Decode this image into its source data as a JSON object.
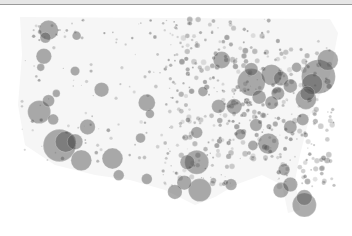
{
  "map": {
    "title": "",
    "region": "contiguous-united-states",
    "mark": "proportional-bubble",
    "bubble_fill": "#4a4a4a",
    "bubble_opacity": 0.45,
    "background_fill": "#f4f4f4",
    "bubbles": [
      {
        "name": "seattle",
        "x": 0.085,
        "y": 0.06,
        "v": 40
      },
      {
        "name": "tacoma",
        "x": 0.075,
        "y": 0.1,
        "v": 12
      },
      {
        "name": "spokane",
        "x": 0.175,
        "y": 0.09,
        "v": 8
      },
      {
        "name": "portland",
        "x": 0.07,
        "y": 0.2,
        "v": 25
      },
      {
        "name": "salem",
        "x": 0.06,
        "y": 0.26,
        "v": 6
      },
      {
        "name": "boise",
        "x": 0.17,
        "y": 0.28,
        "v": 9
      },
      {
        "name": "sf-bay",
        "x": 0.055,
        "y": 0.5,
        "v": 55
      },
      {
        "name": "sacramento",
        "x": 0.085,
        "y": 0.44,
        "v": 15
      },
      {
        "name": "fresno",
        "x": 0.1,
        "y": 0.54,
        "v": 12
      },
      {
        "name": "los-angeles",
        "x": 0.12,
        "y": 0.68,
        "v": 110
      },
      {
        "name": "la-core",
        "x": 0.14,
        "y": 0.66,
        "v": 45
      },
      {
        "name": "inland-empire",
        "x": 0.17,
        "y": 0.66,
        "v": 25
      },
      {
        "name": "san-diego",
        "x": 0.19,
        "y": 0.76,
        "v": 45
      },
      {
        "name": "las-vegas",
        "x": 0.21,
        "y": 0.58,
        "v": 25
      },
      {
        "name": "reno",
        "x": 0.11,
        "y": 0.4,
        "v": 6
      },
      {
        "name": "salt-lake",
        "x": 0.255,
        "y": 0.38,
        "v": 22
      },
      {
        "name": "phoenix",
        "x": 0.29,
        "y": 0.75,
        "v": 45
      },
      {
        "name": "tucson",
        "x": 0.31,
        "y": 0.84,
        "v": 12
      },
      {
        "name": "albuquerque",
        "x": 0.38,
        "y": 0.64,
        "v": 10
      },
      {
        "name": "denver",
        "x": 0.4,
        "y": 0.45,
        "v": 30
      },
      {
        "name": "colorado-springs",
        "x": 0.41,
        "y": 0.51,
        "v": 8
      },
      {
        "name": "el-paso",
        "x": 0.4,
        "y": 0.86,
        "v": 12
      },
      {
        "name": "minneapolis",
        "x": 0.64,
        "y": 0.22,
        "v": 30
      },
      {
        "name": "kansas-city",
        "x": 0.63,
        "y": 0.47,
        "v": 20
      },
      {
        "name": "omaha",
        "x": 0.58,
        "y": 0.39,
        "v": 10
      },
      {
        "name": "oklahoma-city",
        "x": 0.56,
        "y": 0.61,
        "v": 14
      },
      {
        "name": "dallas",
        "x": 0.56,
        "y": 0.77,
        "v": 60
      },
      {
        "name": "fort-worth",
        "x": 0.53,
        "y": 0.77,
        "v": 22
      },
      {
        "name": "austin",
        "x": 0.52,
        "y": 0.88,
        "v": 22
      },
      {
        "name": "san-antonio",
        "x": 0.49,
        "y": 0.93,
        "v": 22
      },
      {
        "name": "houston",
        "x": 0.57,
        "y": 0.92,
        "v": 55
      },
      {
        "name": "new-orleans",
        "x": 0.67,
        "y": 0.89,
        "v": 14
      },
      {
        "name": "memphis",
        "x": 0.7,
        "y": 0.62,
        "v": 12
      },
      {
        "name": "st-louis",
        "x": 0.68,
        "y": 0.47,
        "v": 25
      },
      {
        "name": "chicago",
        "x": 0.735,
        "y": 0.34,
        "v": 80
      },
      {
        "name": "milwaukee",
        "x": 0.735,
        "y": 0.27,
        "v": 18
      },
      {
        "name": "detroit",
        "x": 0.8,
        "y": 0.3,
        "v": 45
      },
      {
        "name": "indianapolis",
        "x": 0.76,
        "y": 0.42,
        "v": 20
      },
      {
        "name": "columbus",
        "x": 0.82,
        "y": 0.4,
        "v": 18
      },
      {
        "name": "cleveland",
        "x": 0.83,
        "y": 0.32,
        "v": 22
      },
      {
        "name": "cincinnati",
        "x": 0.8,
        "y": 0.45,
        "v": 18
      },
      {
        "name": "pittsburgh",
        "x": 0.86,
        "y": 0.36,
        "v": 20
      },
      {
        "name": "nashville",
        "x": 0.75,
        "y": 0.57,
        "v": 16
      },
      {
        "name": "atlanta",
        "x": 0.79,
        "y": 0.67,
        "v": 45
      },
      {
        "name": "birmingham",
        "x": 0.74,
        "y": 0.68,
        "v": 10
      },
      {
        "name": "charlotte",
        "x": 0.86,
        "y": 0.58,
        "v": 18
      },
      {
        "name": "raleigh",
        "x": 0.9,
        "y": 0.54,
        "v": 15
      },
      {
        "name": "dc",
        "x": 0.91,
        "y": 0.43,
        "v": 45
      },
      {
        "name": "baltimore",
        "x": 0.915,
        "y": 0.4,
        "v": 22
      },
      {
        "name": "philadelphia",
        "x": 0.93,
        "y": 0.35,
        "v": 45
      },
      {
        "name": "new-york",
        "x": 0.95,
        "y": 0.31,
        "v": 120
      },
      {
        "name": "boston",
        "x": 0.98,
        "y": 0.22,
        "v": 45
      },
      {
        "name": "buffalo",
        "x": 0.88,
        "y": 0.26,
        "v": 10
      },
      {
        "name": "jacksonville",
        "x": 0.84,
        "y": 0.81,
        "v": 14
      },
      {
        "name": "orlando",
        "x": 0.86,
        "y": 0.89,
        "v": 22
      },
      {
        "name": "tampa",
        "x": 0.83,
        "y": 0.92,
        "v": 25
      },
      {
        "name": "miami",
        "x": 0.905,
        "y": 1.0,
        "v": 60
      },
      {
        "name": "fort-lauderdale",
        "x": 0.905,
        "y": 0.96,
        "v": 25
      }
    ]
  }
}
